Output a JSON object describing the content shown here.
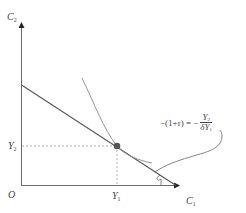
{
  "diagram": {
    "type": "intertemporal-consumption-choice",
    "axes": {
      "x_label": {
        "base": "C",
        "sub": "1"
      },
      "y_label": {
        "base": "C",
        "sub": "2"
      },
      "origin_label": "O"
    },
    "tick_labels": {
      "x_point": {
        "base": "Y",
        "sub": "1"
      },
      "y_point": {
        "base": "Y",
        "sub": "2"
      }
    },
    "annotation": {
      "lhs": "−(1+r) = −",
      "lhs_r": "r",
      "numerator": {
        "base": "Y",
        "sub": "2"
      },
      "denominator": {
        "prefix": "δ",
        "base": "Y",
        "sub": "1"
      }
    },
    "elements": [
      "budget-line",
      "indifference-curve",
      "tangency-point",
      "projection-dashed-lines",
      "slope-angle-arc",
      "annotation-leader"
    ],
    "colors": {
      "axis": "#6b6b6b",
      "budget_line": "#5a5a5a",
      "indifference_curve": "#8a8a8a",
      "point": "#555555",
      "dashed": "#9a9a9a",
      "text": "#444444"
    }
  }
}
